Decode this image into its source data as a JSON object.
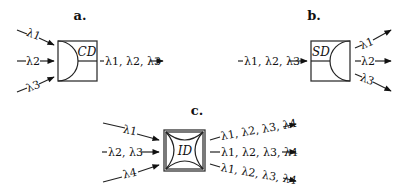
{
  "diagram": {
    "panels": [
      {
        "id": "a",
        "title": "a.",
        "box_label": "CD",
        "inputs": [
          "λ1",
          "λ2",
          "λ3"
        ],
        "outputs": [
          "λ1, λ2, λ3"
        ]
      },
      {
        "id": "b",
        "title": "b.",
        "box_label": "SD",
        "inputs": [
          "λ1, λ2, λ3"
        ],
        "outputs": [
          "λ1",
          "λ2",
          "λ3"
        ]
      },
      {
        "id": "c",
        "title": "c.",
        "box_label": "ID",
        "inputs": [
          "λ1",
          "λ2, λ3",
          "λ4"
        ],
        "outputs": [
          "λ1, λ2, λ3, λ4",
          "λ1, λ2, λ3, λ4",
          "λ1, λ2, λ3, λ4"
        ]
      }
    ]
  },
  "colors": {
    "line": "#222222",
    "background": "#ffffff"
  }
}
